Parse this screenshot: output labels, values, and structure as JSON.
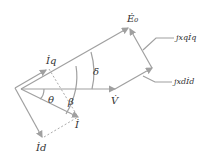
{
  "diagram": {
    "type": "phasor-diagram",
    "colors": {
      "vector": "#a0a0a0",
      "text": "#333333"
    },
    "labels": {
      "E0": "Ė₀",
      "V": "V̇",
      "I": "İ",
      "Iq": "İq",
      "Id": "İd",
      "delta": "δ",
      "theta": "θ",
      "beta": "β",
      "jxqIq": "jxqİq",
      "jxdId": "jxdİd"
    }
  }
}
